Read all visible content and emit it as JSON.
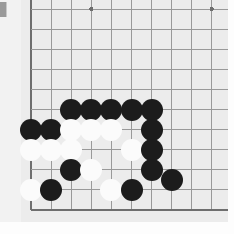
{
  "app": {
    "title": "Go Board Position",
    "type": "go-board-image"
  },
  "board": {
    "background_color": "#ececec",
    "margin_color": "#f2f2f2",
    "line_color": "#999999",
    "edge_line_color": "#6e6e6e",
    "size_label": "19x19",
    "visible_region": "top-left corner",
    "grid": {
      "origin_x": 31,
      "origin_y": 9,
      "spacing": 20.1,
      "vertical_lines": [
        31,
        51.1,
        71.2,
        91.3,
        111.4,
        131.5,
        151.6,
        171.7,
        191.8,
        211.9,
        232.0
      ],
      "horizontal_lines": [
        9,
        29.1,
        49.2,
        69.3,
        89.4,
        109.5,
        129.6,
        149.7,
        169.8,
        189.9,
        210.0
      ]
    },
    "star_points": [
      {
        "name": "star-point-left",
        "x": 91.3,
        "y": 9
      },
      {
        "name": "star-point-right",
        "x": 211.9,
        "y": 9
      }
    ]
  },
  "stones": {
    "radius": 11,
    "black_color": "#1c1c1c",
    "white_color": "#fbfbfb",
    "items": [
      {
        "color": "black",
        "x": 71.2,
        "y": 109.5,
        "label": "black-stone"
      },
      {
        "color": "black",
        "x": 91.3,
        "y": 109.5,
        "label": "black-stone"
      },
      {
        "color": "black",
        "x": 111.4,
        "y": 109.5,
        "label": "black-stone"
      },
      {
        "color": "black",
        "x": 131.5,
        "y": 109.5,
        "label": "black-stone"
      },
      {
        "color": "black",
        "x": 151.6,
        "y": 109.5,
        "label": "black-stone"
      },
      {
        "color": "black",
        "x": 31.0,
        "y": 129.6,
        "label": "black-stone"
      },
      {
        "color": "black",
        "x": 51.1,
        "y": 129.6,
        "label": "black-stone"
      },
      {
        "color": "white",
        "x": 71.2,
        "y": 129.6,
        "label": "white-stone"
      },
      {
        "color": "white",
        "x": 91.3,
        "y": 129.6,
        "label": "white-stone"
      },
      {
        "color": "white",
        "x": 111.4,
        "y": 129.6,
        "label": "white-stone"
      },
      {
        "color": "black",
        "x": 151.6,
        "y": 129.6,
        "label": "black-stone"
      },
      {
        "color": "white",
        "x": 31.0,
        "y": 149.7,
        "label": "white-stone"
      },
      {
        "color": "white",
        "x": 51.1,
        "y": 149.7,
        "label": "white-stone"
      },
      {
        "color": "white",
        "x": 71.2,
        "y": 149.7,
        "label": "white-stone"
      },
      {
        "color": "white",
        "x": 131.5,
        "y": 149.7,
        "label": "white-stone"
      },
      {
        "color": "black",
        "x": 151.6,
        "y": 149.7,
        "label": "black-stone"
      },
      {
        "color": "black",
        "x": 71.2,
        "y": 169.8,
        "label": "black-stone"
      },
      {
        "color": "white",
        "x": 91.3,
        "y": 169.8,
        "label": "white-stone"
      },
      {
        "color": "black",
        "x": 151.6,
        "y": 169.8,
        "label": "black-stone"
      },
      {
        "color": "black",
        "x": 172.0,
        "y": 180.0,
        "label": "black-stone"
      },
      {
        "color": "white",
        "x": 31.0,
        "y": 189.9,
        "label": "white-stone"
      },
      {
        "color": "black",
        "x": 51.1,
        "y": 189.9,
        "label": "black-stone"
      },
      {
        "color": "white",
        "x": 111.4,
        "y": 189.9,
        "label": "white-stone"
      },
      {
        "color": "black",
        "x": 131.5,
        "y": 189.9,
        "label": "black-stone"
      }
    ]
  },
  "overlay": {
    "corner_tab_color": "#9a9a9a"
  }
}
